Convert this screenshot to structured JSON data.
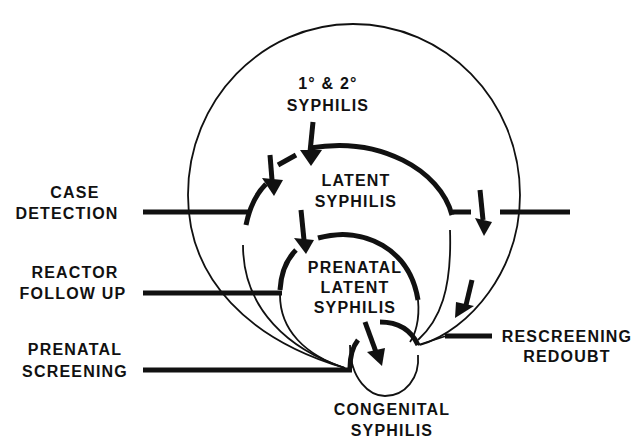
{
  "diagram": {
    "nodes": {
      "primary_secondary": {
        "line1": "1° & 2°",
        "line2": "SYPHILIS"
      },
      "latent": {
        "line1": "LATENT",
        "line2": "SYPHILIS"
      },
      "prenatal_latent": {
        "line1": "PRENATAL",
        "line2": "LATENT",
        "line3": "SYPHILIS"
      },
      "congenital": {
        "line1": "CONGENITAL",
        "line2": "SYPHILIS"
      }
    },
    "barriers": {
      "case_detection": {
        "line1": "CASE",
        "line2": "DETECTION"
      },
      "reactor_follow_up": {
        "line1": "REACTOR",
        "line2": "FOLLOW UP"
      },
      "prenatal_screening": {
        "line1": "PRENATAL",
        "line2": "SCREENING"
      },
      "rescreening_redoubt": {
        "line1": "RESCREENING",
        "line2": "REDOUBT"
      }
    },
    "colors": {
      "ink": "#111111",
      "background": "#ffffff"
    }
  }
}
